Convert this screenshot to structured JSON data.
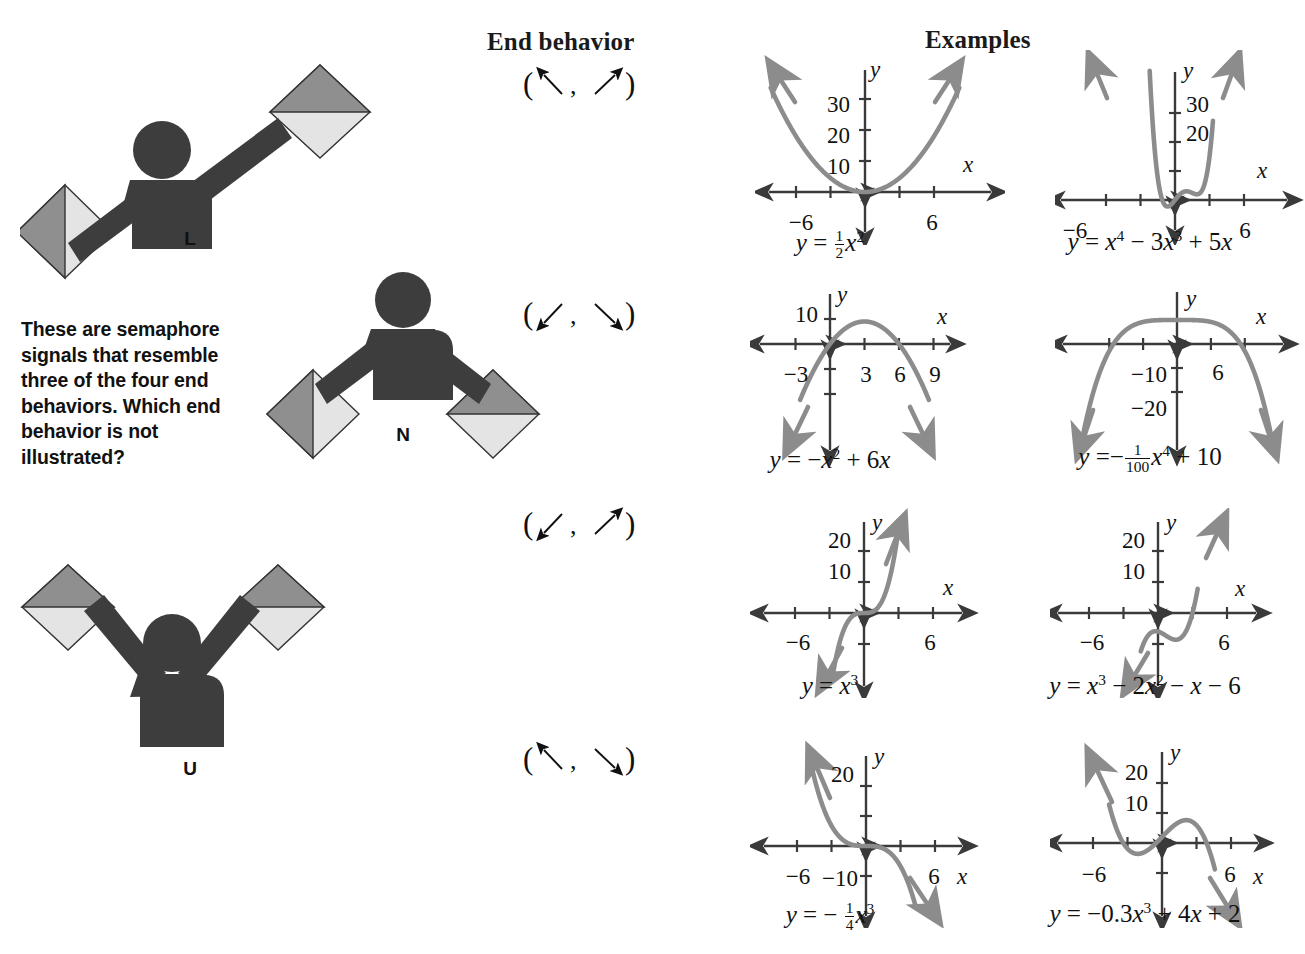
{
  "headers": {
    "end_behavior": "End behavior",
    "examples": "Examples"
  },
  "prompt": "These are semaphore signals that resemble three of the four end behaviors. Which end behavior is not illustrated?",
  "semaphores": [
    {
      "label": "L",
      "description": "semaphore-letter-l",
      "left_arm": "down-left",
      "right_arm": "up-right"
    },
    {
      "label": "N",
      "description": "semaphore-letter-n",
      "left_arm": "down-left",
      "right_arm": "down-right"
    },
    {
      "label": "U",
      "description": "semaphore-letter-u",
      "left_arm": "up-left",
      "right_arm": "up-right"
    }
  ],
  "end_behaviors": [
    {
      "left": "up-left",
      "right": "up-right",
      "notation": "( ↖ , ↗ )"
    },
    {
      "left": "down-left",
      "right": "down-right",
      "notation": "( ↙ , ↘ )"
    },
    {
      "left": "down-left",
      "right": "up-right",
      "notation": "( ↙ , ↗ )"
    },
    {
      "left": "up-left",
      "right": "down-right",
      "notation": "( ↖ , ↘ )"
    }
  ],
  "colors": {
    "curve": "#8c8c8c",
    "axis": "#3a3a3a",
    "figure": "#3d3d3d",
    "flag_dark": "#8a8a8a",
    "flag_light": "#e2e2e2",
    "text": "#111111"
  },
  "chart_data": [
    {
      "type": "line",
      "id": "graph-1",
      "title": "y = 1/2 x^2",
      "equation_html": "<i>y</i> = <span class=\"frac\"><span class=\"num\">1</span><span class=\"den\">2</span></span><i>x</i><sup>2</sup>",
      "function": "0.5*x^2",
      "xlabel": "x",
      "ylabel": "y",
      "xticks": [
        -6,
        6
      ],
      "xtick_labels": [
        "−6",
        "6"
      ],
      "yticks": [
        10,
        20,
        30
      ],
      "ytick_labels": [
        "10",
        "20",
        "30"
      ],
      "xlim": [
        -9,
        9
      ],
      "ylim": [
        -8,
        40
      ],
      "end_behavior": "( ↖ , ↗ )"
    },
    {
      "type": "line",
      "id": "graph-2",
      "title": "y = x^4 - 3x^3 + 5x",
      "equation_html": "<i>y</i> = <i>x</i><sup>4</sup> − 3<i>x</i><sup>3</sup> + 5<i>x</i>",
      "function": "x^4-3x^3+5x",
      "xlabel": "x",
      "ylabel": "y",
      "xticks": [
        -6,
        6
      ],
      "xtick_labels": [
        "−6",
        "6"
      ],
      "yticks": [
        20,
        30
      ],
      "ytick_labels": [
        "20",
        "30"
      ],
      "xlim": [
        -9,
        9
      ],
      "ylim": [
        -12,
        40
      ],
      "end_behavior": "( ↖ , ↗ )"
    },
    {
      "type": "line",
      "id": "graph-3",
      "title": "y = -x^2 + 6x",
      "equation_html": "<i>y</i> = −<i>x</i><sup>2</sup> + 6<i>x</i>",
      "function": "-x^2+6x",
      "xlabel": "x",
      "ylabel": "y",
      "xticks": [
        -3,
        3,
        6,
        9
      ],
      "xtick_labels": [
        "−3",
        "3",
        "6",
        "9"
      ],
      "yticks": [
        10
      ],
      "ytick_labels": [
        "10"
      ],
      "xlim": [
        -6,
        12
      ],
      "ylim": [
        -26,
        16
      ],
      "end_behavior": "( ↙ , ↘ )"
    },
    {
      "type": "line",
      "id": "graph-4",
      "title": "y = -(1/100) x^4 + 10",
      "equation_html": "<i>y</i> =−<span class=\"frac\"><span class=\"num\">1</span><span class=\"den\">100</span></span><i>x</i><sup>4</sup> + 10",
      "function": "-x^4/100+10",
      "xlabel": "x",
      "ylabel": "y",
      "xticks": [
        6
      ],
      "xtick_labels": [
        "6"
      ],
      "yticks": [
        -10,
        -20
      ],
      "ytick_labels": [
        "−10",
        "−20"
      ],
      "xlim": [
        -9,
        9
      ],
      "ylim": [
        -28,
        18
      ],
      "end_behavior": "( ↙ , ↘ )"
    },
    {
      "type": "line",
      "id": "graph-5",
      "title": "y = x^3",
      "equation_html": "<i>y</i> = <i>x</i><sup>3</sup>",
      "function": "x^3",
      "xlabel": "x",
      "ylabel": "y",
      "xticks": [
        -6,
        6
      ],
      "xtick_labels": [
        "−6",
        "6"
      ],
      "yticks": [
        10,
        20
      ],
      "ytick_labels": [
        "10",
        "20"
      ],
      "xlim": [
        -9,
        9
      ],
      "ylim": [
        -25,
        28
      ],
      "end_behavior": "( ↙ , ↗ )"
    },
    {
      "type": "line",
      "id": "graph-6",
      "title": "y = x^3 - 2x^2 - x - 6",
      "equation_html": "<i>y</i> = <i>x</i><sup>3</sup> − 2<i>x</i><sup>2</sup> − <i>x</i> − 6",
      "function": "x^3-2x^2-x-6",
      "xlabel": "x",
      "ylabel": "y",
      "xticks": [
        -6,
        6
      ],
      "xtick_labels": [
        "−6",
        "6"
      ],
      "yticks": [
        10,
        20
      ],
      "ytick_labels": [
        "10",
        "20"
      ],
      "xlim": [
        -9,
        9
      ],
      "ylim": [
        -25,
        28
      ],
      "end_behavior": "( ↙ , ↗ )"
    },
    {
      "type": "line",
      "id": "graph-7",
      "title": "y = -1/4 x^3",
      "equation_html": "<i>y</i> = − <span class=\"frac\"><span class=\"num\">1</span><span class=\"den\">4</span></span><i>x</i><sup>3</sup>",
      "function": "-x^3/4",
      "xlabel": "x",
      "ylabel": "y",
      "xticks": [
        -6,
        6
      ],
      "xtick_labels": [
        "−6",
        "6"
      ],
      "yticks": [
        20,
        -10
      ],
      "ytick_labels": [
        "20",
        "−10"
      ],
      "xlim": [
        -9,
        9
      ],
      "ylim": [
        -28,
        30
      ],
      "end_behavior": "( ↖ , ↘ )"
    },
    {
      "type": "line",
      "id": "graph-8",
      "title": "y = -0.3x^3 + 4x + 2",
      "equation_html": "<i>y</i> = −0.3<i>x</i><sup>3</sup> + 4<i>x</i> + 2",
      "function": "-0.3x^3+4x+2",
      "xlabel": "x",
      "ylabel": "y",
      "xticks": [
        -6,
        6
      ],
      "xtick_labels": [
        "−6",
        "6"
      ],
      "yticks": [
        10,
        20
      ],
      "ytick_labels": [
        "10",
        "20"
      ],
      "xlim": [
        -9,
        9
      ],
      "ylim": [
        -25,
        30
      ],
      "end_behavior": "( ↖ , ↘ )"
    }
  ]
}
